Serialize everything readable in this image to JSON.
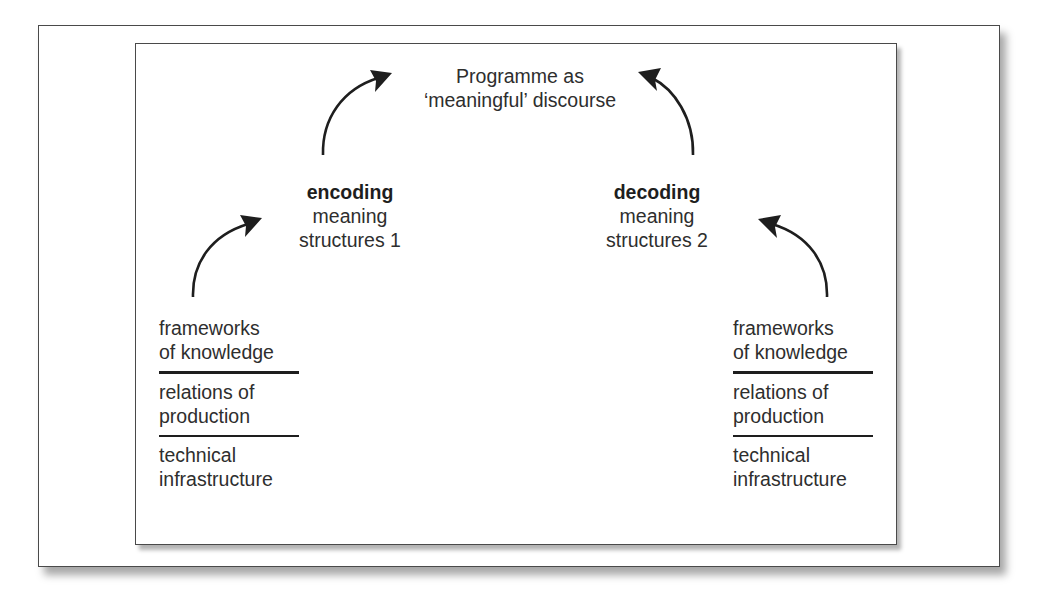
{
  "diagram": {
    "top": {
      "line1": "Programme as",
      "line2": "‘meaningful’ discourse"
    },
    "encoding": {
      "title": "encoding",
      "line1": "meaning",
      "line2": "structures 1"
    },
    "decoding": {
      "title": "decoding",
      "line1": "meaning",
      "line2": "structures 2"
    },
    "left_stack": {
      "frameworks": [
        "frameworks",
        "of knowledge"
      ],
      "relations": [
        "relations of",
        "production"
      ],
      "technical": [
        "technical",
        "infrastructure"
      ]
    },
    "right_stack": {
      "frameworks": [
        "frameworks",
        "of knowledge"
      ],
      "relations": [
        "relations of",
        "production"
      ],
      "technical": [
        "technical",
        "infrastructure"
      ]
    },
    "arrows": [
      {
        "from": "left_stack",
        "to": "encoding",
        "icon": "curved-arrow-icon"
      },
      {
        "from": "encoding",
        "to": "top",
        "icon": "curved-arrow-icon"
      },
      {
        "from": "decoding",
        "to": "top",
        "icon": "curved-arrow-icon"
      },
      {
        "from": "right_stack",
        "to": "decoding",
        "icon": "curved-arrow-icon"
      }
    ]
  }
}
